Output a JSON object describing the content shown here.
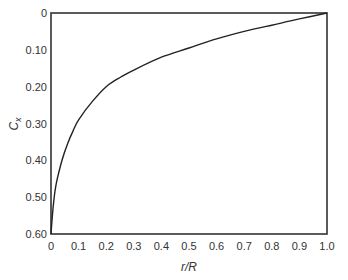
{
  "chart_data": {
    "type": "line",
    "title": "",
    "xlabel": "r/R",
    "ylabel": "C_x",
    "ylabel_display": "C",
    "ylabel_sub": "x",
    "xlim": [
      0,
      1.0
    ],
    "ylim": [
      0.6,
      0
    ],
    "y_inverted": true,
    "grid": false,
    "legend": null,
    "x_ticks": [
      "0",
      "0.1",
      "0.2",
      "0.3",
      "0.4",
      "0.5",
      "0.6",
      "0.7",
      "0.8",
      "0.9",
      "1.0"
    ],
    "y_ticks": [
      "0",
      "0.10",
      "0.20",
      "0.30",
      "0.40",
      "0.50",
      "0.60"
    ],
    "series": [
      {
        "name": "C_x",
        "color": "#222222",
        "x": [
          0.0,
          0.005,
          0.01,
          0.02,
          0.04,
          0.06,
          0.08,
          0.1,
          0.15,
          0.2,
          0.25,
          0.3,
          0.4,
          0.5,
          0.6,
          0.7,
          0.8,
          0.9,
          1.0
        ],
        "y": [
          0.6,
          0.55,
          0.51,
          0.46,
          0.4,
          0.355,
          0.32,
          0.29,
          0.24,
          0.2,
          0.175,
          0.155,
          0.12,
          0.095,
          0.07,
          0.05,
          0.033,
          0.016,
          0.0
        ]
      }
    ]
  }
}
